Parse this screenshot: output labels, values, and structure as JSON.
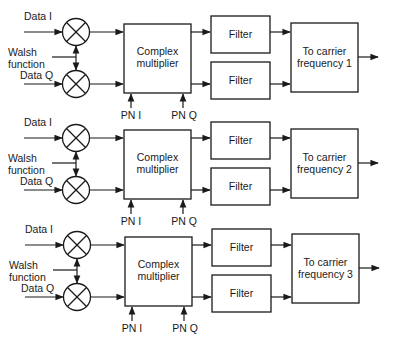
{
  "diagram": {
    "title": "",
    "rows": [
      {
        "id": 1,
        "y0": 0,
        "data_i_label": "Data I",
        "walsh_label_1": "Walsh",
        "walsh_label_2": "function",
        "data_q_label": "Data Q",
        "multiplier_label_1": "Complex",
        "multiplier_label_2": "multiplier",
        "pn_i_label": "PN I",
        "pn_q_label": "PN Q",
        "filter_top_label": "Filter",
        "filter_bottom_label": "Filter",
        "carrier_label_1": "To carrier",
        "carrier_label_2": "frequency 1"
      },
      {
        "id": 2,
        "y0": 106,
        "data_i_label": "Data I",
        "walsh_label_1": "Walsh",
        "walsh_label_2": "function",
        "data_q_label": "Data Q",
        "multiplier_label_1": "Complex",
        "multiplier_label_2": "multiplier",
        "pn_i_label": "PN I",
        "pn_q_label": "PN Q",
        "filter_top_label": "Filter",
        "filter_bottom_label": "Filter",
        "carrier_label_1": "To carrier",
        "carrier_label_2": "frequency 2"
      },
      {
        "id": 3,
        "y0": 213,
        "data_i_label": "Data I",
        "walsh_label_1": "Walsh",
        "walsh_label_2": "function",
        "data_q_label": "Data Q",
        "multiplier_label_1": "Complex",
        "multiplier_label_2": "multiplier",
        "pn_i_label": "PN I",
        "pn_q_label": "PN Q",
        "filter_top_label": "Filter",
        "filter_bottom_label": "Filter",
        "carrier_label_1": "To carrier",
        "carrier_label_2": "frequency 3"
      }
    ],
    "icons": {
      "mixer": "multiplier-circle-x",
      "arrow": "arrowhead"
    },
    "colors": {
      "stroke": "#1a1a1a",
      "background": "#ffffff"
    }
  }
}
